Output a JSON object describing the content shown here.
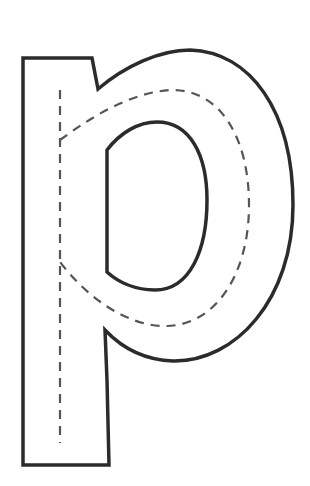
{
  "worksheet": {
    "letter": "p",
    "description": "Letter p tracing outline with dashed guide stroke",
    "outline_color": "#2b2b2b",
    "guide_color": "#555555",
    "background": "#ffffff"
  }
}
